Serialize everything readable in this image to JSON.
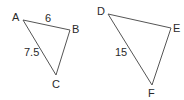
{
  "diagram": {
    "stroke_color": "#555555",
    "label_color": "#2a2a2a",
    "triangles": [
      {
        "name": "ABC",
        "vertices": [
          {
            "label": "A",
            "x": 23,
            "y": 20,
            "lx": 12,
            "ly": 21
          },
          {
            "label": "B",
            "x": 70,
            "y": 30,
            "lx": 72,
            "ly": 33
          },
          {
            "label": "C",
            "x": 56,
            "y": 75,
            "lx": 52,
            "ly": 88
          }
        ],
        "sides": [
          {
            "between": "AB",
            "length_label": "6",
            "lx": 45,
            "ly": 22
          },
          {
            "between": "AC",
            "length_label": "7.5",
            "lx": 24,
            "ly": 56
          }
        ]
      },
      {
        "name": "DEF",
        "vertices": [
          {
            "label": "D",
            "x": 108,
            "y": 14,
            "lx": 97,
            "ly": 15
          },
          {
            "label": "E",
            "x": 171,
            "y": 28,
            "lx": 173,
            "ly": 32
          },
          {
            "label": "F",
            "x": 152,
            "y": 85,
            "lx": 148,
            "ly": 97
          }
        ],
        "sides": [
          {
            "between": "DF",
            "length_label": "15",
            "lx": 115,
            "ly": 56
          }
        ]
      }
    ]
  }
}
